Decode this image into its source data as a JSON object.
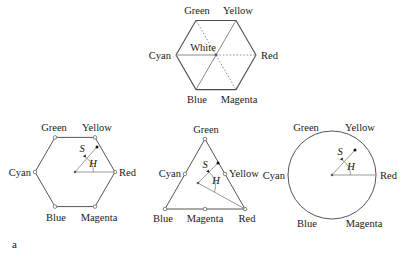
{
  "figure": {
    "panel_tag": "a",
    "caption_labels": {
      "saturation": "S",
      "hue": "H"
    },
    "colors": {
      "outline": "#555555",
      "spoke": "#8a8a8a",
      "text": "#1a1a1a",
      "background": "#ffffff"
    }
  },
  "panels": [
    {
      "id": "rgb-color-hexagon",
      "name": "rgb-color-hexagon",
      "shape": "hexagon",
      "center_label": "White",
      "vertex_labels": {
        "green": "Green",
        "yellow": "Yellow",
        "red": "Red",
        "magenta": "Magenta",
        "blue": "Blue",
        "cyan": "Cyan"
      },
      "spokes_solid": [
        "Cyan",
        "Yellow",
        "Blue"
      ],
      "spokes_dotted": [
        "Green",
        "Red",
        "Magenta"
      ]
    },
    {
      "id": "hue-saturation-hexagon",
      "name": "hue-saturation-hexagon",
      "shape": "hexagon",
      "vertex_labels": {
        "green": "Green",
        "yellow": "Yellow",
        "red": "Red",
        "magenta": "Magenta",
        "blue": "Blue",
        "cyan": "Cyan"
      },
      "annotations": {
        "saturation": "S",
        "hue": "H"
      }
    },
    {
      "id": "hue-saturation-triangle",
      "name": "hue-saturation-triangle",
      "shape": "triangle",
      "vertex_labels": {
        "green": "Green",
        "yellow": "Yellow",
        "red": "Red",
        "magenta": "Magenta",
        "blue": "Blue",
        "cyan": "Cyan"
      },
      "annotations": {
        "saturation": "S",
        "hue": "H"
      }
    },
    {
      "id": "hue-saturation-circle",
      "name": "hue-saturation-circle",
      "shape": "circle",
      "vertex_labels": {
        "green": "Green",
        "yellow": "Yellow",
        "red": "Red",
        "magenta": "Magenta",
        "blue": "Blue",
        "cyan": "Cyan"
      },
      "annotations": {
        "saturation": "S",
        "hue": "H"
      }
    }
  ]
}
